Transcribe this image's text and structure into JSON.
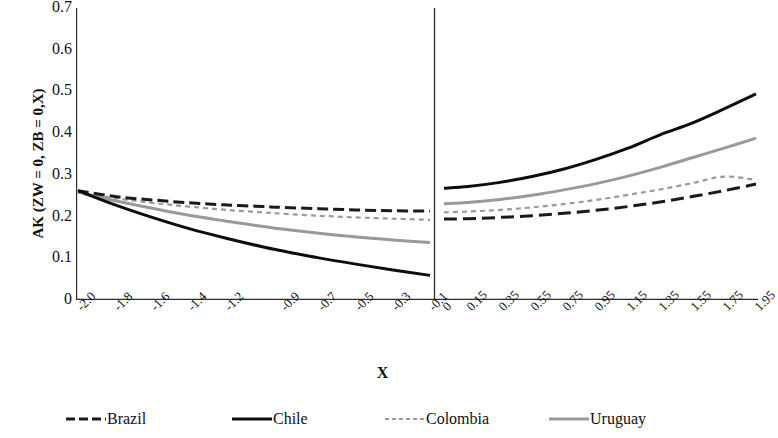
{
  "chart_data": {
    "type": "line",
    "title": "",
    "xlabel": "X",
    "ylabel": "AK (ZW = 0, ZB = 0,X)",
    "ylim": [
      0,
      0.7
    ],
    "y_ticks": [
      "0.7",
      "0.6",
      "0.5",
      "0.4",
      "0.3",
      "0.2",
      "0.1",
      "0"
    ],
    "y_tick_values": [
      0.7,
      0.6,
      0.5,
      0.4,
      0.3,
      0.2,
      0.1,
      0
    ],
    "grid": false,
    "legend_position": "bottom",
    "panels": [
      {
        "name": "left-panel",
        "x_ticks": [
          "-2.0",
          "-1.8",
          "-1.6",
          "-1.4",
          "-1.2",
          "-0.9",
          "-0.7",
          "-0.5",
          "-0.3",
          "-0.1"
        ],
        "x_tick_values": [
          -2.0,
          -1.8,
          -1.6,
          -1.4,
          -1.2,
          -0.9,
          -0.7,
          -0.5,
          -0.3,
          -0.1
        ],
        "xlim": [
          -2.0,
          -0.1
        ]
      },
      {
        "name": "right-panel",
        "x_ticks": [
          "0",
          "0.15",
          "0.35",
          "0.55",
          "0.75",
          "0.95",
          "1.15",
          "1.35",
          "1.55",
          "1.75",
          "1.95"
        ],
        "x_tick_values": [
          0,
          0.15,
          0.35,
          0.55,
          0.75,
          0.95,
          1.15,
          1.35,
          1.55,
          1.75,
          1.95
        ],
        "xlim": [
          0,
          1.95
        ]
      }
    ],
    "series": [
      {
        "name": "Brazil",
        "color": "#1a1a1a",
        "style": "dashed",
        "left_x": [
          -2.0,
          -1.8,
          -1.6,
          -1.4,
          -1.2,
          -1.0,
          -0.9,
          -0.7,
          -0.5,
          -0.3,
          -0.1
        ],
        "left_y": [
          0.262,
          0.248,
          0.24,
          0.233,
          0.228,
          0.224,
          0.222,
          0.219,
          0.216,
          0.214,
          0.213
        ],
        "right_x": [
          0.0,
          0.15,
          0.35,
          0.55,
          0.75,
          0.95,
          1.15,
          1.35,
          1.55,
          1.75,
          1.95
        ],
        "right_y": [
          0.194,
          0.195,
          0.198,
          0.202,
          0.208,
          0.215,
          0.224,
          0.235,
          0.248,
          0.262,
          0.278
        ]
      },
      {
        "name": "Chile",
        "color": "#0d0d0d",
        "style": "solid",
        "left_x": [
          -2.0,
          -1.8,
          -1.6,
          -1.4,
          -1.2,
          -1.0,
          -0.9,
          -0.7,
          -0.5,
          -0.3,
          -0.1
        ],
        "left_y": [
          0.262,
          0.228,
          0.198,
          0.171,
          0.148,
          0.127,
          0.118,
          0.101,
          0.086,
          0.072,
          0.059
        ],
        "right_x": [
          0.0,
          0.15,
          0.35,
          0.55,
          0.75,
          0.95,
          1.15,
          1.35,
          1.55,
          1.75,
          1.95
        ],
        "right_y": [
          0.268,
          0.272,
          0.282,
          0.296,
          0.314,
          0.337,
          0.364,
          0.396,
          0.424,
          0.458,
          0.494
        ]
      },
      {
        "name": "Colombia",
        "color": "#9a9a9a",
        "style": "dotted",
        "left_x": [
          -2.0,
          -1.8,
          -1.6,
          -1.4,
          -1.2,
          -1.0,
          -0.9,
          -0.7,
          -0.5,
          -0.3,
          -0.1
        ],
        "left_y": [
          0.258,
          0.244,
          0.233,
          0.224,
          0.216,
          0.21,
          0.207,
          0.202,
          0.198,
          0.195,
          0.192
        ],
        "right_x": [
          0.0,
          0.15,
          0.35,
          0.55,
          0.75,
          0.95,
          1.15,
          1.35,
          1.55,
          1.75,
          1.95
        ],
        "right_y": [
          0.21,
          0.212,
          0.216,
          0.222,
          0.23,
          0.24,
          0.252,
          0.265,
          0.28,
          0.296,
          0.288
        ]
      },
      {
        "name": "Uruguay",
        "color": "#9a9a9a",
        "style": "solid",
        "left_x": [
          -2.0,
          -1.8,
          -1.6,
          -1.4,
          -1.2,
          -1.0,
          -0.9,
          -0.7,
          -0.5,
          -0.3,
          -0.1
        ],
        "left_y": [
          0.258,
          0.238,
          0.22,
          0.203,
          0.189,
          0.176,
          0.17,
          0.16,
          0.151,
          0.144,
          0.138
        ],
        "right_x": [
          0.0,
          0.15,
          0.35,
          0.55,
          0.75,
          0.95,
          1.15,
          1.35,
          1.55,
          1.75,
          1.95
        ],
        "right_y": [
          0.231,
          0.234,
          0.241,
          0.251,
          0.264,
          0.279,
          0.297,
          0.318,
          0.341,
          0.364,
          0.388
        ]
      }
    ],
    "legend": [
      {
        "label": "Brazil",
        "style": "dashed",
        "color": "#1a1a1a"
      },
      {
        "label": "Chile",
        "style": "solid",
        "color": "#0d0d0d"
      },
      {
        "label": "Colombia",
        "style": "dotted",
        "color": "#9a9a9a"
      },
      {
        "label": "Uruguay",
        "style": "solid",
        "color": "#9a9a9a"
      }
    ]
  }
}
